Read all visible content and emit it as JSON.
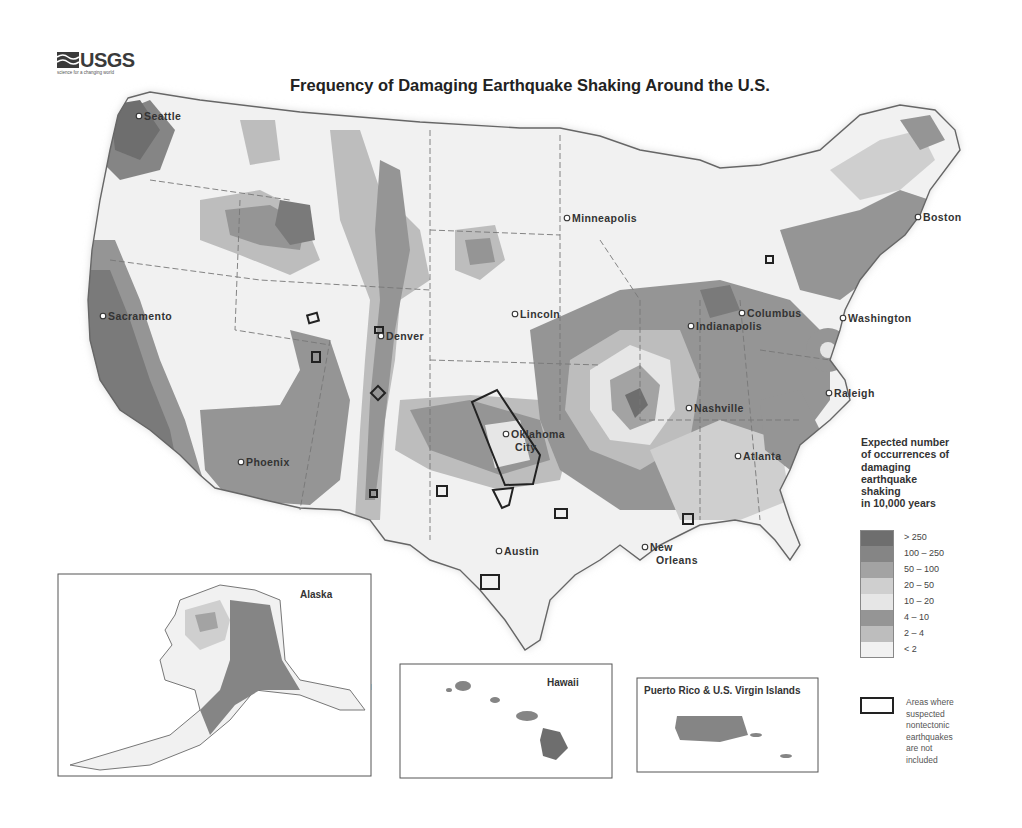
{
  "header": {
    "logo_text": "USGS",
    "logo_tagline": "science for a changing world",
    "title": "Frequency of Damaging Earthquake Shaking Around the U.S."
  },
  "map": {
    "cities": [
      {
        "name": "Seattle",
        "x": 139,
        "y": 116
      },
      {
        "name": "Sacramento",
        "x": 103,
        "y": 316
      },
      {
        "name": "Phoenix",
        "x": 241,
        "y": 462
      },
      {
        "name": "Denver",
        "x": 381,
        "y": 336
      },
      {
        "name": "Minneapolis",
        "x": 567,
        "y": 218
      },
      {
        "name": "Lincoln",
        "x": 515,
        "y": 314
      },
      {
        "name": "Oklahoma",
        "x": 506,
        "y": 434
      },
      {
        "name": "City",
        "x": 510,
        "y": 447
      },
      {
        "name": "Austin",
        "x": 499,
        "y": 551
      },
      {
        "name": "New",
        "x": 645,
        "y": 547
      },
      {
        "name": "Orleans",
        "x": 651,
        "y": 560
      },
      {
        "name": "Nashville",
        "x": 689,
        "y": 408
      },
      {
        "name": "Atlanta",
        "x": 738,
        "y": 456
      },
      {
        "name": "Indianapolis",
        "x": 691,
        "y": 326
      },
      {
        "name": "Columbus",
        "x": 742,
        "y": 313
      },
      {
        "name": "Washington",
        "x": 843,
        "y": 318
      },
      {
        "name": "Raleigh",
        "x": 829,
        "y": 393
      },
      {
        "name": "Boston",
        "x": 918,
        "y": 217
      }
    ],
    "insets": {
      "alaska": {
        "title": "Alaska",
        "cities": [
          {
            "name": "Fairbanks",
            "x": 251,
            "y": 641
          },
          {
            "name": "Anchorage",
            "x": 248,
            "y": 678
          },
          {
            "name": "Juneau",
            "x": 328,
            "y": 686
          }
        ]
      },
      "hawaii": {
        "title": "Hawaii",
        "cities": [
          {
            "name": "Honolulu",
            "x": 499,
            "y": 704
          }
        ]
      },
      "puerto_rico": {
        "title": "Puerto Rico & U.S. Virgin Islands",
        "cities": [
          {
            "name": "San Juan",
            "x": 722,
            "y": 717
          }
        ]
      }
    }
  },
  "legend": {
    "title": "Expected number of occurrences of damaging earthquake shaking in 10,000 years",
    "title_lines": [
      "Expected number",
      "of occurrences of",
      "damaging",
      "earthquake",
      "shaking",
      "in 10,000 years"
    ],
    "classes": [
      {
        "label": "> 250",
        "color": "#6e6e6e"
      },
      {
        "label": "100 – 250",
        "color": "#858585"
      },
      {
        "label": "50 – 100",
        "color": "#a3a3a3"
      },
      {
        "label": "20 – 50",
        "color": "#cfcfcf"
      },
      {
        "label": "10 – 20",
        "color": "#e6e6e6"
      },
      {
        "label": "4 – 10",
        "color": "#959595"
      },
      {
        "label": "2 – 4",
        "color": "#bdbdbd"
      },
      {
        "label": "< 2",
        "color": "#f1f1f1"
      }
    ],
    "nontectonic_label": "Areas where suspected nontectonic earthquakes are not included",
    "nontectonic_lines": [
      "Areas where",
      "suspected",
      "nontectonic",
      "earthquakes",
      "are not",
      "included"
    ]
  }
}
